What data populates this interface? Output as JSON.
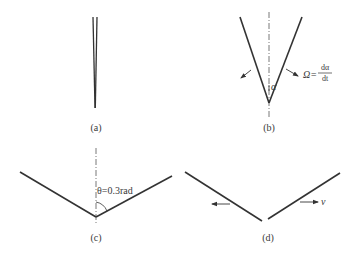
{
  "figure": {
    "panels": [
      {
        "id": "a",
        "caption": "(a)",
        "description": "narrow crack, two nearly parallel faces converging"
      },
      {
        "id": "b",
        "caption": "(b)",
        "angle_symbol": "α",
        "rate_lhs": "Ω=",
        "rate_num": "dα",
        "rate_den": "dt",
        "description": "V-opening with angular rate"
      },
      {
        "id": "c",
        "caption": "(c)",
        "angle_label": "θ=0.3rad",
        "description": "wide V with half-angle 0.3 rad"
      },
      {
        "id": "d",
        "caption": "(d)",
        "velocity_symbol": "v",
        "description": "two separated faces moving apart"
      }
    ],
    "colors": {
      "line": "#333333",
      "axis": "#555555",
      "text": "#3a3a3a",
      "background": "#ffffff"
    }
  }
}
